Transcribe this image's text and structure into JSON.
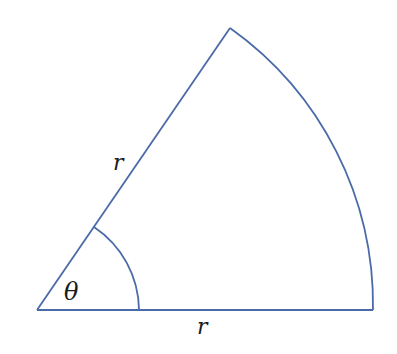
{
  "diagram": {
    "type": "circular-sector",
    "stroke_color": "#4a6aa8",
    "labels": {
      "upper_radius": "r",
      "lower_radius": "r",
      "angle": "θ"
    }
  }
}
